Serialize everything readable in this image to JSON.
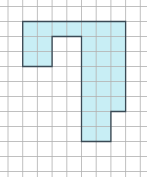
{
  "diagram": {
    "type": "grid-shape",
    "grid": {
      "cols": 9,
      "rows": 11,
      "origin_x": 8,
      "origin_y": 6.5,
      "cell_w": 14.7,
      "cell_h": 15,
      "line_color": "#b0b0b0",
      "background": "#ffffff"
    },
    "shape": {
      "fill": "#c8eef5",
      "outline": "#3a4a55",
      "cells": [
        [
          1,
          1
        ],
        [
          2,
          1
        ],
        [
          3,
          1
        ],
        [
          4,
          1
        ],
        [
          5,
          1
        ],
        [
          6,
          1
        ],
        [
          7,
          1
        ],
        [
          1,
          2
        ],
        [
          2,
          2
        ],
        [
          5,
          2
        ],
        [
          6,
          2
        ],
        [
          7,
          2
        ],
        [
          1,
          3
        ],
        [
          2,
          3
        ],
        [
          5,
          3
        ],
        [
          6,
          3
        ],
        [
          7,
          3
        ],
        [
          5,
          4
        ],
        [
          6,
          4
        ],
        [
          7,
          4
        ],
        [
          5,
          5
        ],
        [
          6,
          5
        ],
        [
          7,
          5
        ],
        [
          5,
          6
        ],
        [
          6,
          6
        ],
        [
          7,
          6
        ],
        [
          5,
          7
        ],
        [
          6,
          7
        ],
        [
          5,
          8
        ],
        [
          6,
          8
        ]
      ],
      "outline_points": [
        [
          1,
          1
        ],
        [
          8,
          1
        ],
        [
          8,
          7
        ],
        [
          7,
          7
        ],
        [
          7,
          9
        ],
        [
          5,
          9
        ],
        [
          5,
          2
        ],
        [
          3,
          2
        ],
        [
          3,
          4
        ],
        [
          1,
          4
        ]
      ]
    }
  }
}
